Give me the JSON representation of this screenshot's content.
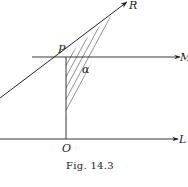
{
  "figure": {
    "caption": "Fig. 14.3",
    "labels": {
      "R": "R",
      "P": "P",
      "M": "M",
      "alpha": "α",
      "O": "O",
      "L": "L"
    },
    "colors": {
      "ink": "#222222",
      "background": "#ffffff"
    }
  }
}
